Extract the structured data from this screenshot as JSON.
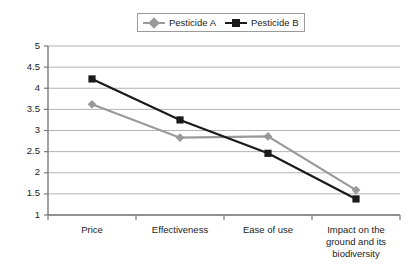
{
  "chart_data": {
    "type": "line",
    "title": "",
    "xlabel": "",
    "ylabel": "",
    "categories": [
      "Price",
      "Effectiveness",
      "Ease of use",
      "Impact on the ground and its biodiversity"
    ],
    "category_lines": [
      [
        "Price"
      ],
      [
        "Effectiveness"
      ],
      [
        "Ease of use"
      ],
      [
        "Impact on the",
        "ground and its",
        "biodiversity"
      ]
    ],
    "series": [
      {
        "name": "Pesticide A",
        "values": [
          3.62,
          2.83,
          2.86,
          1.59
        ],
        "color": "#999999",
        "marker": "diamond"
      },
      {
        "name": "Pesticide B",
        "values": [
          4.22,
          3.25,
          2.46,
          1.38
        ],
        "color": "#1a1a1a",
        "marker": "square"
      }
    ],
    "ylim": [
      1,
      5
    ],
    "yticks": [
      1,
      1.5,
      2,
      2.5,
      3,
      3.5,
      4,
      4.5,
      5
    ],
    "ytick_labels": [
      "1",
      "1.5",
      "2",
      "2.5",
      "3",
      "3.5",
      "4",
      "4.5",
      "5"
    ],
    "grid": true,
    "grid_axis": "y",
    "grid_color": "#b3b3b3",
    "axis_color": "#7a7a7a",
    "legend_position": "top-center"
  }
}
